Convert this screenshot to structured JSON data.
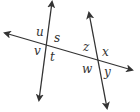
{
  "diagram": {
    "type": "geometry-lines-transversal",
    "line_color": "#333333",
    "lines": [
      {
        "name": "line-left",
        "x1": 52,
        "y1": 2,
        "x2": 39,
        "y2": 100,
        "arrows": "both"
      },
      {
        "name": "line-right",
        "x1": 89,
        "y1": 13,
        "x2": 107,
        "y2": 108,
        "arrows": "both"
      },
      {
        "name": "transversal",
        "x1": 5,
        "y1": 33,
        "x2": 132,
        "y2": 70,
        "arrows": "both"
      }
    ],
    "angle_labels": [
      {
        "id": "u",
        "text": "u",
        "x": 36,
        "y": 36
      },
      {
        "id": "s",
        "text": "s",
        "x": 54,
        "y": 42
      },
      {
        "id": "v",
        "text": "v",
        "x": 34,
        "y": 55
      },
      {
        "id": "t",
        "text": "t",
        "x": 50,
        "y": 61
      },
      {
        "id": "z",
        "text": "z",
        "x": 83,
        "y": 51
      },
      {
        "id": "x",
        "text": "x",
        "x": 102,
        "y": 56
      },
      {
        "id": "w",
        "text": "w",
        "x": 82,
        "y": 73
      },
      {
        "id": "y",
        "text": "y",
        "x": 104,
        "y": 76
      }
    ]
  }
}
